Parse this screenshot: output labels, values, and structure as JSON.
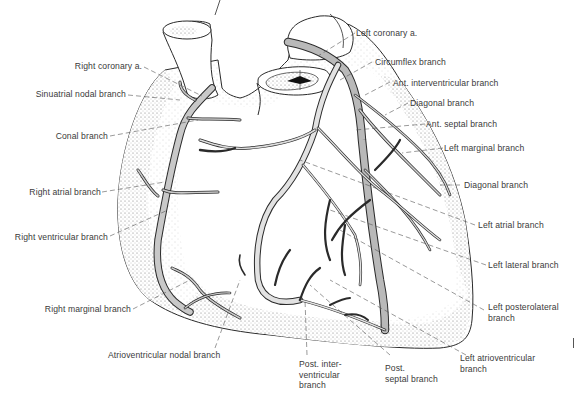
{
  "figure": {
    "vessel_color": "#c8c8c8",
    "outline_color": "#2a2a2a",
    "stipple_color": "#8a8a8a"
  },
  "labels": {
    "right_coronary": "Right coronary a.",
    "sinuatrial_nodal": "Sinuatrial nodal branch",
    "conal": "Conal branch",
    "right_atrial": "Right atrial branch",
    "right_ventricular": "Right ventricular branch",
    "right_marginal": "Right marginal branch",
    "atrioventricular_nodal": "Atrioventricular nodal branch",
    "left_coronary": "Left coronary a.",
    "circumflex": "Circumflex branch",
    "ant_interventricular": "Ant. interventricular branch",
    "diagonal_1": "Diagonal branch",
    "ant_septal": "Ant. septal branch",
    "left_marginal": "Left marginal branch",
    "diagonal_2": "Diagonal branch",
    "left_atrial": "Left atrial branch",
    "left_lateral": "Left lateral branch",
    "left_posterolateral": "Left posterolateral\nbranch",
    "left_atrioventricular": "Left atrioventricular\nbranch",
    "post_septal": "Post.\nseptal branch",
    "post_interventricular": "Post. inter-\nventricular\nbranch"
  }
}
